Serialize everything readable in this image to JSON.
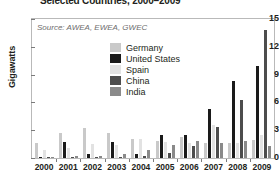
{
  "chart": {
    "title": "Selected Countries, 2000–2009",
    "source_note": "Source: AWEA, EWEA, GWEC",
    "y_axis_title": "Gigawatts"
  },
  "legend": {
    "items": [
      {
        "label": "Germany",
        "color": "#c9c9c9"
      },
      {
        "label": "United States",
        "color": "#1a1a1a"
      },
      {
        "label": "Spain",
        "color": "#e2e2e2"
      },
      {
        "label": "China",
        "color": "#4d4d4d"
      },
      {
        "label": "India",
        "color": "#8a8a8a"
      }
    ]
  },
  "chart_data": {
    "type": "bar",
    "title": "Selected Countries, 2000–2009",
    "xlabel": "",
    "ylabel": "Gigawatts",
    "ylim": [
      0,
      15
    ],
    "yticks": [
      0,
      3,
      6,
      9,
      12,
      15
    ],
    "grid": false,
    "legend_position": "inside-upper-center",
    "categories": [
      "2000",
      "2001",
      "2002",
      "2003",
      "2004",
      "2005",
      "2006",
      "2007",
      "2008",
      "2009"
    ],
    "series": [
      {
        "name": "Germany",
        "color": "#c9c9c9",
        "values": [
          1.67,
          2.66,
          3.25,
          2.65,
          2.06,
          1.81,
          2.23,
          1.67,
          1.67,
          1.92
        ]
      },
      {
        "name": "United States",
        "color": "#1a1a1a",
        "values": [
          0.07,
          1.7,
          0.43,
          1.69,
          0.39,
          2.43,
          2.45,
          5.26,
          8.36,
          9.92
        ]
      },
      {
        "name": "Spain",
        "color": "#e2e2e2",
        "values": [
          0.82,
          1.05,
          1.49,
          1.38,
          2.06,
          1.76,
          1.59,
          3.52,
          1.61,
          2.46
        ]
      },
      {
        "name": "China",
        "color": "#4d4d4d",
        "values": [
          0.08,
          0.06,
          0.07,
          0.1,
          0.2,
          0.5,
          1.35,
          3.3,
          6.3,
          13.8
        ]
      },
      {
        "name": "India",
        "color": "#8a8a8a",
        "values": [
          0.15,
          0.24,
          0.19,
          0.42,
          0.88,
          1.43,
          1.84,
          1.58,
          1.8,
          1.27
        ]
      }
    ]
  }
}
